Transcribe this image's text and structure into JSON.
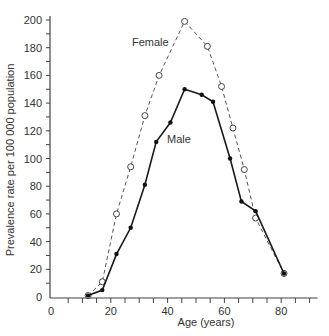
{
  "chart_data": {
    "type": "line",
    "title": "",
    "xlabel": "Age (years)",
    "ylabel": "Prevalence rate per 100 000 population",
    "xlim": [
      0,
      90
    ],
    "ylim": [
      0,
      200
    ],
    "xticks_major": [
      0,
      20,
      40,
      60,
      80
    ],
    "xticks_minor_step": 5,
    "yticks_major": [
      0,
      20,
      40,
      60,
      80,
      100,
      120,
      140,
      160,
      180,
      200
    ],
    "yticks_minor_step": 10,
    "grid": false,
    "legend": "inline labels",
    "series": [
      {
        "name": "Female",
        "style": "dashed",
        "marker": "open-circle",
        "x": [
          12,
          17,
          22,
          27,
          32,
          37,
          46,
          54,
          59,
          63,
          67,
          71,
          81
        ],
        "values": [
          1,
          11,
          60,
          94,
          131,
          160,
          199,
          181,
          152,
          122,
          92,
          57,
          17
        ]
      },
      {
        "name": "Male",
        "style": "solid",
        "marker": "filled-circle",
        "x": [
          12,
          17,
          22,
          27,
          32,
          36,
          41,
          46,
          52,
          56,
          62,
          66,
          71,
          81
        ],
        "values": [
          1,
          5,
          31,
          50,
          81,
          112,
          126,
          150,
          146,
          141,
          100,
          69,
          62,
          17
        ]
      }
    ],
    "annotations": [
      {
        "text": "Female",
        "near": "female series at age ~33"
      },
      {
        "text": "Male",
        "near": "male series at age ~42"
      }
    ]
  },
  "labels": {
    "female": "Female",
    "male": "Male",
    "xlabel": "Age (years)",
    "ylabel": "Prevalence rate per 100 000 population"
  }
}
